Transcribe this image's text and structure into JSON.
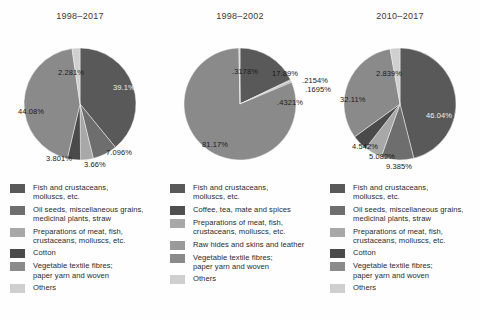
{
  "top_clipped_text": "",
  "palette": {
    "fish": "#595959",
    "oilseeds": "#6e6e6e",
    "preparations": "#a8a8a8",
    "cotton": "#4a4a4a",
    "vegtextile": "#8a8a8a",
    "others": "#cfcfcf",
    "coffee": "#4f4f4f",
    "rawhides": "#9a9a9a"
  },
  "charts": [
    {
      "title": "1998–2017",
      "chart_data": {
        "type": "pie",
        "title": "1998–2017",
        "labels": [
          "Fish and crustaceans, molluscs, etc.",
          "Oil seeds, miscellaneous grains, medicinal plants, straw",
          "Preparations of meat, fish, crustaceans, molluscs, etc.",
          "Cotton",
          "Vegetable textile fibres; paper yarn and woven",
          "Others"
        ],
        "values": [
          39.1,
          7.096,
          3.66,
          3.801,
          44.08,
          2.281
        ],
        "value_labels": [
          "39.1%",
          "7.096%",
          "3.66%",
          "3.801%",
          "44.08%",
          "2.281%"
        ],
        "legend_position": "below"
      },
      "slices": [
        {
          "label": "39.1%",
          "value": 39.1,
          "color_key": "fish",
          "x": 113,
          "y": 62,
          "dark": false
        },
        {
          "label": "7.096%",
          "value": 7.096,
          "color_key": "oilseeds",
          "x": 106,
          "y": 127,
          "dark": true
        },
        {
          "label": "3.66%",
          "value": 3.66,
          "color_key": "preparations",
          "x": 84,
          "y": 139,
          "dark": true
        },
        {
          "label": "3.801%",
          "value": 3.801,
          "color_key": "cotton",
          "x": 46,
          "y": 133,
          "dark": true
        },
        {
          "label": "44.08%",
          "value": 44.08,
          "color_key": "vegtextile",
          "x": 18,
          "y": 86,
          "dark": true
        },
        {
          "label": "2.281%",
          "value": 2.281,
          "color_key": "others",
          "x": 58,
          "y": 47,
          "dark": true
        }
      ],
      "legend": [
        {
          "color_key": "fish",
          "line1": "Fish and crustaceans,",
          "line2": "molluscs, etc."
        },
        {
          "color_key": "oilseeds",
          "line1": "Oil seeds, miscellaneous grains,",
          "line2": "medicinal plants, straw"
        },
        {
          "color_key": "preparations",
          "line1": "Preparations of meat, fish,",
          "line2": "crustaceans, molluscs, etc."
        },
        {
          "color_key": "cotton",
          "line1": "Cotton",
          "line2": ""
        },
        {
          "color_key": "vegtextile",
          "line1": "Vegetable textile fibres;",
          "line2": "paper yarn and woven"
        },
        {
          "color_key": "others",
          "line1": "Others",
          "line2": ""
        }
      ]
    },
    {
      "title": "1998–2002",
      "chart_data": {
        "type": "pie",
        "title": "1998–2002",
        "labels": [
          "Fish and crustaceans, molluscs, etc.",
          "Coffee, tea, mate and spices",
          "Preparations of meat, fish, crustaceans, molluscs, etc.",
          "Raw hides and skins and leather",
          "Vegetable textile fibres; paper yarn and woven",
          "Others"
        ],
        "values": [
          17.89,
          0.2154,
          0.1695,
          0.4321,
          81.17,
          0.3178
        ],
        "value_labels": [
          "17.89%",
          ".2154%",
          ".1695%",
          ".4321%",
          "81.17%",
          ".3178%"
        ],
        "legend_position": "below"
      },
      "slices": [
        {
          "label": "17.89%",
          "value": 17.89,
          "color_key": "fish",
          "x": 112,
          "y": 48,
          "dark": true
        },
        {
          "label": ".2154%",
          "value": 0.2154,
          "color_key": "coffee",
          "x": 142,
          "y": 55,
          "dark": true
        },
        {
          "label": ".1695%",
          "value": 0.1695,
          "color_key": "preparations",
          "x": 145,
          "y": 64,
          "dark": true
        },
        {
          "label": ".4321%",
          "value": 0.4321,
          "color_key": "rawhides",
          "x": 117,
          "y": 77,
          "dark": true
        },
        {
          "label": "81.17%",
          "value": 81.17,
          "color_key": "vegtextile",
          "x": 42,
          "y": 119,
          "dark": true
        },
        {
          "label": ".3178%",
          "value": 0.3178,
          "color_key": "others",
          "x": 72,
          "y": 46,
          "dark": true
        }
      ],
      "legend": [
        {
          "color_key": "fish",
          "line1": "Fish and crustaceans,",
          "line2": "molluscs, etc."
        },
        {
          "color_key": "coffee",
          "line1": "Coffee, tea, mate and spices",
          "line2": ""
        },
        {
          "color_key": "preparations",
          "line1": "Preparations of meat, fish,",
          "line2": "crustaceans, molluscs, etc."
        },
        {
          "color_key": "rawhides",
          "line1": "Raw hides and skins and leather",
          "line2": ""
        },
        {
          "color_key": "vegtextile",
          "line1": "Vegetable textile fibres;",
          "line2": "paper yarn and woven"
        },
        {
          "color_key": "others",
          "line1": "Others",
          "line2": ""
        }
      ]
    },
    {
      "title": "2010–2017",
      "chart_data": {
        "type": "pie",
        "title": "2010–2017",
        "labels": [
          "Fish and crustaceans, molluscs, etc.",
          "Oil seeds, miscellaneous grains, medicinal plants, straw",
          "Preparations of meat, fish, crustaceans, molluscs, etc.",
          "Cotton",
          "Vegetable textile fibres; paper yarn and woven",
          "Others"
        ],
        "values": [
          46.04,
          9.385,
          5.082,
          4.542,
          32.11,
          2.839
        ],
        "value_labels": [
          "46.04%",
          "9.385%",
          "5.082%",
          "4.542%",
          "32.11%",
          "2.839%"
        ],
        "legend_position": "below"
      },
      "slices": [
        {
          "label": "46.04%",
          "value": 46.04,
          "color_key": "fish",
          "x": 106,
          "y": 90,
          "dark": false
        },
        {
          "label": "9.385%",
          "value": 9.385,
          "color_key": "oilseeds",
          "x": 66,
          "y": 141,
          "dark": true
        },
        {
          "label": "5.082%",
          "value": 5.082,
          "color_key": "preparations",
          "x": 49,
          "y": 131,
          "dark": true
        },
        {
          "label": "4.542%",
          "value": 4.542,
          "color_key": "cotton",
          "x": 32,
          "y": 121,
          "dark": true
        },
        {
          "label": "32.11%",
          "value": 32.11,
          "color_key": "vegtextile",
          "x": 20,
          "y": 74,
          "dark": true
        },
        {
          "label": "2.839%",
          "value": 2.839,
          "color_key": "others",
          "x": 56,
          "y": 48,
          "dark": true
        }
      ],
      "legend": [
        {
          "color_key": "fish",
          "line1": "Fish and crustaceans,",
          "line2": "molluscs, etc."
        },
        {
          "color_key": "oilseeds",
          "line1": "Oil seeds, miscellaneous grains,",
          "line2": "medicinal plants, straw"
        },
        {
          "color_key": "preparations",
          "line1": "Preparations of meat, fish,",
          "line2": "crustaceans, molluscs, etc."
        },
        {
          "color_key": "cotton",
          "line1": "Cotton",
          "line2": ""
        },
        {
          "color_key": "vegtextile",
          "line1": "Vegetable textile fibres;",
          "line2": "paper yarn and woven"
        },
        {
          "color_key": "others",
          "line1": "Others",
          "line2": ""
        }
      ]
    }
  ]
}
